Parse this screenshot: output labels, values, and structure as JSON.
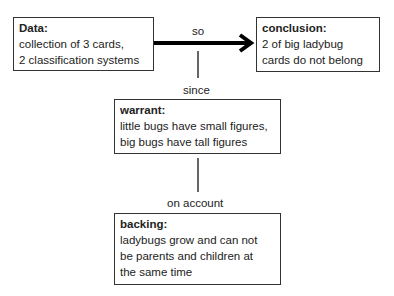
{
  "nodes": {
    "data": {
      "title": "Data:",
      "lines": [
        "collection of 3 cards,",
        "2 classification systems"
      ]
    },
    "conclusion": {
      "title": "conclusion:",
      "lines": [
        "2 of big ladybug",
        "cards do not belong"
      ]
    },
    "warrant": {
      "title": "warrant:",
      "lines": [
        "little bugs have small figures,",
        "big bugs have tall figures"
      ]
    },
    "backing": {
      "title": "backing:",
      "lines": [
        "ladybugs grow and can not",
        "be parents and children at",
        "the same time"
      ]
    }
  },
  "edges": {
    "data_to_conclusion": {
      "label": "so"
    },
    "warrant_to_arrow": {
      "label": "since"
    },
    "backing_to_warrant": {
      "label": "on account"
    }
  }
}
